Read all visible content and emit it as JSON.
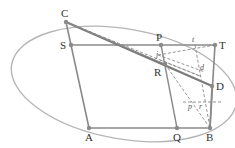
{
  "diagram": {
    "type": "geometry-construction",
    "colors": {
      "ellipse": "#b5b5b5",
      "solid_line": "#8a8a8a",
      "bold_line": "#7a7a7a",
      "dashed_line": "#888888",
      "point": "#8a8a8a",
      "label": "#333333"
    },
    "points": {
      "C": {
        "label": "C",
        "x": 66,
        "y": 22
      },
      "S": {
        "label": "S",
        "x": 71,
        "y": 45
      },
      "P": {
        "label": "P",
        "x": 161,
        "y": 45
      },
      "T": {
        "label": "T",
        "x": 215,
        "y": 45
      },
      "R": {
        "label": "R",
        "x": 165,
        "y": 64
      },
      "D": {
        "label": "D",
        "x": 212,
        "y": 86
      },
      "A": {
        "label": "A",
        "x": 89,
        "y": 128
      },
      "Q": {
        "label": "Q",
        "x": 177,
        "y": 128
      },
      "B": {
        "label": "B",
        "x": 210,
        "y": 128
      }
    },
    "small_labels": {
      "t": "t",
      "j": "j",
      "d": "d",
      "p": "p",
      "r": "r"
    }
  }
}
